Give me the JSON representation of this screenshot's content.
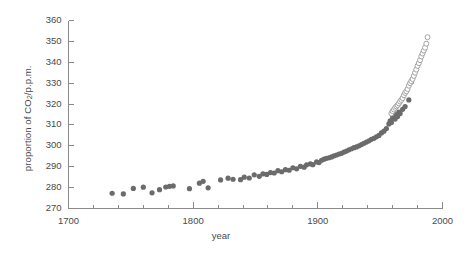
{
  "chart_data": {
    "type": "scatter",
    "title": "",
    "xlabel": "year",
    "ylabel": "proportion of CO2/p.p.m.",
    "ylabel_main": "proportion of CO",
    "ylabel_sub": "2",
    "ylabel_tail": "/p.p.m.",
    "xlim": [
      1700,
      2000
    ],
    "ylim": [
      270,
      360
    ],
    "xticks": [
      1700,
      1800,
      1900,
      2000
    ],
    "xtick_labels": [
      "1700",
      "1800",
      "1900",
      "2000"
    ],
    "xminor_step": 20,
    "yticks": [
      270,
      280,
      290,
      300,
      310,
      320,
      330,
      340,
      350,
      360
    ],
    "ytick_labels": [
      "270",
      "280",
      "290",
      "300",
      "310",
      "320",
      "330",
      "340",
      "350",
      "360"
    ],
    "grid": false,
    "legend": "none",
    "marker_color": "#6b6b6b",
    "open_marker_stroke": "#9a9a9a",
    "axis_color": "#8a8a8a",
    "series": [
      {
        "name": "ice-core",
        "marker": "filled-circle",
        "color": "#6b6b6b",
        "points": [
          [
            1735,
            277.3
          ],
          [
            1744,
            277.0
          ],
          [
            1752,
            279.6
          ],
          [
            1760,
            280.2
          ],
          [
            1767,
            277.5
          ],
          [
            1773,
            279.0
          ],
          [
            1778,
            280.3
          ],
          [
            1781,
            280.6
          ],
          [
            1784,
            280.8
          ],
          [
            1797,
            279.5
          ],
          [
            1805,
            282.1
          ],
          [
            1808,
            283.0
          ],
          [
            1812,
            279.9
          ],
          [
            1822,
            283.7
          ],
          [
            1828,
            284.5
          ],
          [
            1832,
            284.0
          ],
          [
            1838,
            283.8
          ],
          [
            1841,
            285.0
          ],
          [
            1845,
            284.6
          ],
          [
            1849,
            286.1
          ],
          [
            1853,
            285.4
          ],
          [
            1856,
            286.6
          ],
          [
            1859,
            286.3
          ],
          [
            1862,
            287.2
          ],
          [
            1865,
            287.0
          ],
          [
            1868,
            288.1
          ],
          [
            1871,
            287.6
          ],
          [
            1874,
            288.6
          ],
          [
            1877,
            288.3
          ],
          [
            1880,
            289.5
          ],
          [
            1883,
            289.0
          ],
          [
            1886,
            290.2
          ],
          [
            1889,
            289.8
          ],
          [
            1891,
            290.9
          ],
          [
            1894,
            291.4
          ],
          [
            1896,
            291.0
          ],
          [
            1899,
            292.3
          ],
          [
            1901,
            292.0
          ],
          [
            1903,
            293.1
          ],
          [
            1905,
            293.6
          ],
          [
            1907,
            294.0
          ],
          [
            1909,
            294.3
          ],
          [
            1911,
            294.7
          ],
          [
            1913,
            295.2
          ],
          [
            1915,
            295.6
          ],
          [
            1917,
            296.1
          ],
          [
            1919,
            296.4
          ],
          [
            1921,
            297.0
          ],
          [
            1923,
            297.5
          ],
          [
            1925,
            298.1
          ],
          [
            1927,
            298.6
          ],
          [
            1929,
            299.1
          ],
          [
            1931,
            299.5
          ],
          [
            1933,
            300.0
          ],
          [
            1935,
            300.6
          ],
          [
            1937,
            301.2
          ],
          [
            1939,
            301.8
          ],
          [
            1941,
            302.4
          ],
          [
            1943,
            303.1
          ],
          [
            1945,
            303.6
          ],
          [
            1947,
            304.3
          ],
          [
            1949,
            305.0
          ],
          [
            1951,
            306.2
          ],
          [
            1953,
            307.0
          ],
          [
            1955,
            308.3
          ],
          [
            1957,
            310.5
          ],
          [
            1958,
            312.0
          ],
          [
            1959,
            311.2
          ],
          [
            1960,
            313.6
          ],
          [
            1961,
            314.2
          ],
          [
            1962,
            312.8
          ],
          [
            1963,
            315.0
          ],
          [
            1964,
            314.0
          ],
          [
            1965,
            316.2
          ],
          [
            1966,
            315.5
          ],
          [
            1968,
            317.5
          ],
          [
            1970,
            318.8
          ],
          [
            1973,
            322.0
          ],
          [
            1975,
            330.5
          ]
        ]
      },
      {
        "name": "direct-measurement",
        "marker": "open-circle",
        "color": "#9a9a9a",
        "points": [
          [
            1959,
            315.5
          ],
          [
            1960,
            316.6
          ],
          [
            1961,
            317.4
          ],
          [
            1962,
            318.2
          ],
          [
            1963,
            318.9
          ],
          [
            1964,
            319.5
          ],
          [
            1965,
            320.3
          ],
          [
            1966,
            321.2
          ],
          [
            1967,
            322.0
          ],
          [
            1968,
            322.9
          ],
          [
            1969,
            324.2
          ],
          [
            1970,
            325.3
          ],
          [
            1971,
            326.1
          ],
          [
            1972,
            327.2
          ],
          [
            1973,
            328.8
          ],
          [
            1974,
            330.0
          ],
          [
            1975,
            331.0
          ],
          [
            1976,
            332.0
          ],
          [
            1977,
            333.5
          ],
          [
            1978,
            335.0
          ],
          [
            1979,
            336.5
          ],
          [
            1980,
            338.3
          ],
          [
            1981,
            339.6
          ],
          [
            1982,
            341.0
          ],
          [
            1983,
            342.8
          ],
          [
            1984,
            344.2
          ],
          [
            1985,
            345.6
          ],
          [
            1986,
            347.0
          ],
          [
            1987,
            348.9
          ],
          [
            1988,
            352.0
          ]
        ]
      }
    ]
  }
}
